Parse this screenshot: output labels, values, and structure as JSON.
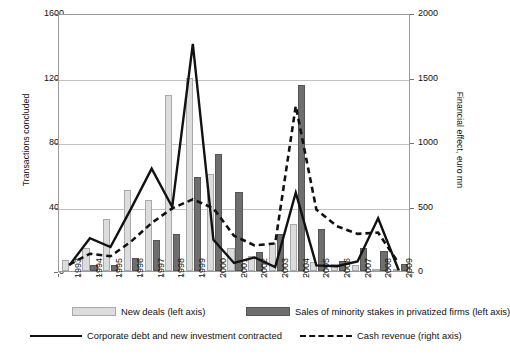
{
  "chart_data": {
    "type": "bar",
    "title": "",
    "xlabel": "",
    "ylabel": "Transactions concluded",
    "y2label": "Financial effect, euro mn",
    "grid": true,
    "legend_position": "bottom",
    "ylim": [
      0,
      1600
    ],
    "y2lim": [
      0,
      2000
    ],
    "yticks": [
      "0",
      "400",
      "800",
      "1200",
      "1600"
    ],
    "y2ticks": [
      "0",
      "500",
      "1000",
      "1500",
      "2000"
    ],
    "categories": [
      "1993",
      "1994",
      "1995",
      "1996",
      "1997",
      "1998",
      "1999",
      "2000",
      "2001",
      "2002",
      "2003",
      "2004",
      "2005",
      "2006",
      "2007",
      "2008",
      "2009"
    ],
    "series": [
      {
        "name": "New deals (left axis)",
        "type": "bar",
        "axis": "left",
        "color": "#dcdcdc",
        "values": [
          70,
          145,
          320,
          505,
          440,
          1090,
          1200,
          600,
          145,
          95,
          175,
          290,
          55,
          45,
          40,
          15,
          10
        ]
      },
      {
        "name": "Sales of minority stakes in privatized firms (left axis)",
        "type": "bar",
        "axis": "left",
        "color": "#6e6e6e",
        "values": [
          0,
          35,
          35,
          80,
          195,
          230,
          580,
          725,
          490,
          120,
          230,
          1155,
          260,
          65,
          140,
          125,
          45
        ]
      },
      {
        "name": "Corporate debt and new investment contracted",
        "type": "line",
        "style": "solid",
        "axis": "left",
        "color": "#111111",
        "values": [
          35,
          205,
          150,
          390,
          640,
          400,
          1420,
          195,
          50,
          85,
          25,
          490,
          35,
          30,
          60,
          330,
          5
        ]
      },
      {
        "name": "Cash revenue (right axis)",
        "type": "line",
        "style": "dashed",
        "axis": "right",
        "color": "#111111",
        "values": [
          50,
          135,
          115,
          230,
          375,
          490,
          560,
          490,
          275,
          200,
          215,
          1290,
          480,
          350,
          290,
          300,
          60
        ]
      }
    ]
  },
  "legend": [
    {
      "label": "New deals (left axis)",
      "marker": "light-bar-swatch"
    },
    {
      "label": "Sales of minority stakes in privatized firms (left axis)",
      "marker": "dark-bar-swatch"
    },
    {
      "label": "Corporate debt and new investment contracted",
      "marker": "solid-line-swatch"
    },
    {
      "label": "Cash revenue (right axis)",
      "marker": "dashed-line-swatch"
    }
  ]
}
